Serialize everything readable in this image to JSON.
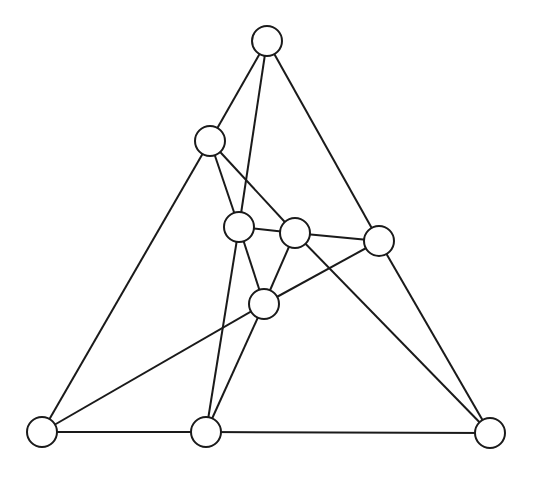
{
  "diagram": {
    "type": "graph",
    "node_radius": 15,
    "stroke_color": "#1a1a1a",
    "fill_color": "#ffffff",
    "nodes": [
      {
        "id": "A",
        "x": 267,
        "y": 41
      },
      {
        "id": "B",
        "x": 210,
        "y": 141
      },
      {
        "id": "D",
        "x": 239,
        "y": 227
      },
      {
        "id": "E",
        "x": 295,
        "y": 233
      },
      {
        "id": "F",
        "x": 379,
        "y": 241
      },
      {
        "id": "G",
        "x": 264,
        "y": 304
      },
      {
        "id": "J",
        "x": 42,
        "y": 432
      },
      {
        "id": "H",
        "x": 206,
        "y": 432
      },
      {
        "id": "I",
        "x": 490,
        "y": 433
      }
    ],
    "edges": [
      [
        "A",
        "B"
      ],
      [
        "A",
        "D"
      ],
      [
        "A",
        "F"
      ],
      [
        "B",
        "J"
      ],
      [
        "B",
        "D"
      ],
      [
        "B",
        "E"
      ],
      [
        "D",
        "E"
      ],
      [
        "D",
        "G"
      ],
      [
        "D",
        "H"
      ],
      [
        "E",
        "F"
      ],
      [
        "E",
        "G"
      ],
      [
        "E",
        "I"
      ],
      [
        "F",
        "G"
      ],
      [
        "F",
        "I"
      ],
      [
        "G",
        "J"
      ],
      [
        "G",
        "H"
      ],
      [
        "J",
        "H"
      ],
      [
        "H",
        "I"
      ]
    ]
  }
}
